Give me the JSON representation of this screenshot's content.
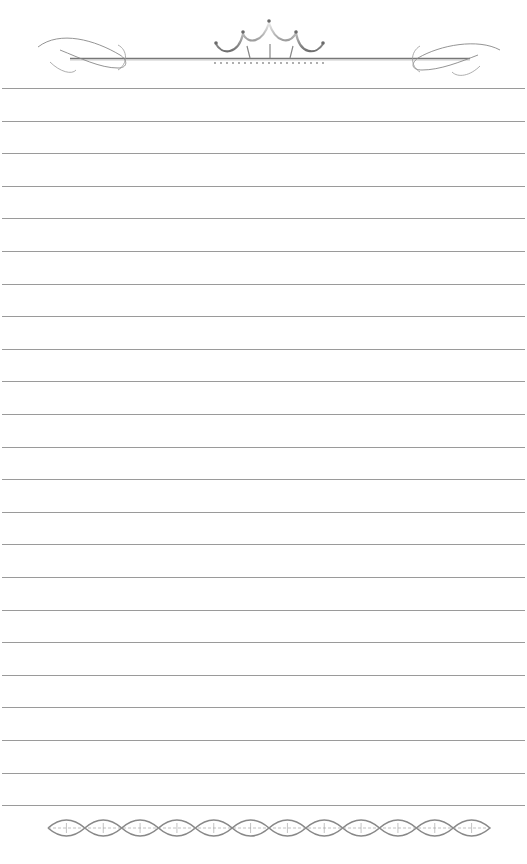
{
  "page": {
    "type": "lined-stationery",
    "background": "#ffffff",
    "line_color": "#9a9a9a",
    "ornament_color": "#7a7a7a",
    "line_count": 23,
    "first_line_y": 88,
    "line_spacing": 32.6
  },
  "header": {
    "ornament": "crown-scroll-divider"
  },
  "footer": {
    "ornament": "diamond-chain-border",
    "diamond_count": 12
  }
}
